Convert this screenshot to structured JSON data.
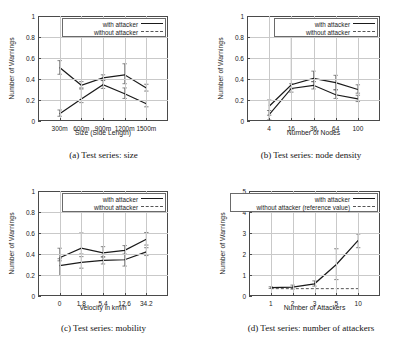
{
  "figure": {
    "panels": [
      {
        "id": "a",
        "caption": "(a) Test series: size",
        "xlabel": "Size (Side Length)",
        "ylabel": "Number of Warnings"
      },
      {
        "id": "b",
        "caption": "(b) Test series: node density",
        "xlabel": "Number of Nodes",
        "ylabel": "Number of Warnings"
      },
      {
        "id": "c",
        "caption": "(c) Test series: mobility",
        "xlabel": "Velocity in km/h",
        "ylabel": "Number of Warnings"
      },
      {
        "id": "d",
        "caption": "(d) Test series: number of attackers",
        "xlabel": "Number of Attackers",
        "ylabel": "Number of Warnings"
      }
    ]
  },
  "chart_data": [
    {
      "type": "line",
      "panel": "a",
      "title": "(a) Test series: size",
      "xlabel": "Size (Side Length)",
      "ylabel": "Number of Warnings",
      "categories": [
        "300m",
        "600m",
        "900m",
        "1200m",
        "1500m"
      ],
      "ytick_labels": [
        "0",
        "0.2",
        "0.4",
        "0.6",
        "0.8",
        "1"
      ],
      "ytick_values": [
        0,
        0.2,
        0.4,
        0.6,
        0.8,
        1
      ],
      "ylim": [
        0,
        1
      ],
      "grid": true,
      "legend_position": "top-right",
      "series": [
        {
          "name": "with attacker",
          "style": "solid",
          "values": [
            0.51,
            0.34,
            0.41,
            0.44,
            0.315
          ],
          "err_low": [
            0.445,
            0.315,
            0.385,
            0.355,
            0.285
          ],
          "err_high": [
            0.575,
            0.375,
            0.44,
            0.545,
            0.35
          ]
        },
        {
          "name": "without attacker",
          "style": "dashed",
          "values": [
            0.07,
            0.21,
            0.345,
            0.26,
            0.165
          ],
          "err_low": [
            0.045,
            0.175,
            0.31,
            0.215,
            0.135
          ],
          "err_high": [
            0.105,
            0.305,
            0.39,
            0.315,
            0.195
          ]
        }
      ]
    },
    {
      "type": "line",
      "panel": "b",
      "title": "(b) Test series: node density",
      "xlabel": "Number of Nodes",
      "ylabel": "Number of Warnings",
      "categories": [
        "4",
        "16",
        "36",
        "64",
        "100"
      ],
      "ytick_labels": [
        "0",
        "0.2",
        "0.4",
        "0.6",
        "0.8",
        "1"
      ],
      "ytick_values": [
        0,
        0.2,
        0.4,
        0.6,
        0.8,
        1
      ],
      "ylim": [
        0,
        1
      ],
      "grid": true,
      "legend_position": "top-right",
      "series": [
        {
          "name": "with attacker",
          "style": "solid",
          "values": [
            0.14,
            0.345,
            0.405,
            0.365,
            0.3
          ],
          "err_low": [
            0.055,
            0.305,
            0.375,
            0.3,
            0.265
          ],
          "err_high": [
            0.2,
            0.855,
            0.475,
            0.435,
            0.345
          ]
        },
        {
          "name": "without attacker",
          "style": "dashed",
          "values": [
            0.06,
            0.31,
            0.34,
            0.25,
            0.21
          ],
          "err_low": [
            0.01,
            0.275,
            0.305,
            0.215,
            0.185
          ],
          "err_high": [
            0.1,
            0.355,
            0.375,
            0.295,
            0.245
          ]
        }
      ]
    },
    {
      "type": "line",
      "panel": "c",
      "title": "(c) Test series: mobility",
      "xlabel": "Velocity in km/h",
      "ylabel": "Number of Warnings",
      "categories": [
        "0",
        "1.8",
        "5.4",
        "12.6",
        "34.2"
      ],
      "ytick_labels": [
        "0",
        "0.2",
        "0.4",
        "0.6",
        "0.8",
        "1"
      ],
      "ytick_values": [
        0,
        0.2,
        0.4,
        0.6,
        0.8,
        1
      ],
      "ylim": [
        0,
        1
      ],
      "grid": true,
      "legend_position": "top-right",
      "series": [
        {
          "name": "with attacker",
          "style": "solid",
          "values": [
            0.365,
            0.455,
            0.41,
            0.435,
            0.54
          ],
          "err_low": [
            0.335,
            0.4,
            0.375,
            0.395,
            0.485
          ],
          "err_high": [
            0.455,
            0.6,
            0.47,
            0.48,
            0.605
          ]
        },
        {
          "name": "without attacker",
          "style": "dashed",
          "values": [
            0.29,
            0.32,
            0.34,
            0.345,
            0.42
          ],
          "err_low": [
            0.195,
            0.265,
            0.305,
            0.285,
            0.385
          ],
          "err_high": [
            0.355,
            0.375,
            0.37,
            0.4,
            0.46
          ]
        }
      ]
    },
    {
      "type": "line",
      "panel": "d",
      "title": "(d) Test series: number of attackers",
      "xlabel": "Number of Attackers",
      "ylabel": "Number of Warnings",
      "categories": [
        "1",
        "2",
        "3",
        "5",
        "10"
      ],
      "ytick_labels": [
        "0",
        "1",
        "2",
        "3",
        "4",
        "5"
      ],
      "ytick_values": [
        0,
        1,
        2,
        3,
        4,
        5
      ],
      "ylim": [
        0,
        5
      ],
      "grid": true,
      "legend_position": "top-right",
      "series": [
        {
          "name": "with attacker",
          "style": "solid",
          "values": [
            0.4,
            0.42,
            0.58,
            1.5,
            2.65
          ],
          "err_low": [
            0.36,
            0.33,
            0.47,
            0.78,
            2.3
          ],
          "err_high": [
            0.44,
            0.52,
            0.72,
            2.25,
            2.95
          ]
        },
        {
          "name": "without attacker (reference value)",
          "style": "dashed",
          "values": [
            0.35,
            0.35,
            0.35,
            0.35,
            0.35
          ],
          "err_low": [
            0.35,
            0.35,
            0.35,
            0.35,
            0.35
          ],
          "err_high": [
            0.35,
            0.35,
            0.35,
            0.35,
            0.35
          ]
        }
      ]
    }
  ]
}
